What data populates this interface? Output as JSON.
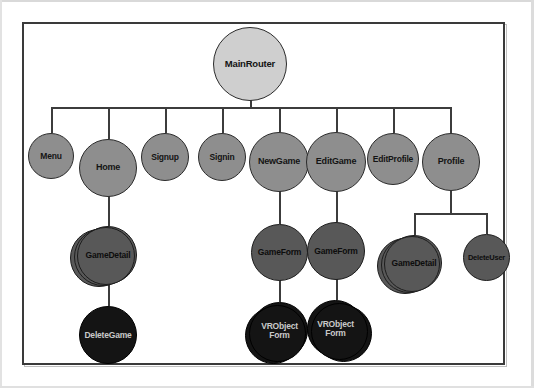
{
  "diagram": {
    "type": "tree",
    "colors": {
      "root_fill": "#cfcfcf",
      "level1_fill": "#8e8e8e",
      "level2_fill": "#585858",
      "level3_fill": "#141414",
      "stroke": "#2b2b2b",
      "frame": "#3a3a3a",
      "background": "#ffffff"
    },
    "root": {
      "id": "mainrouter",
      "label": "MainRouter"
    },
    "level1": [
      {
        "id": "menu",
        "label": "Menu"
      },
      {
        "id": "home",
        "label": "Home"
      },
      {
        "id": "signup",
        "label": "Signup"
      },
      {
        "id": "signin",
        "label": "Signin"
      },
      {
        "id": "newgame",
        "label": "NewGame"
      },
      {
        "id": "editgame",
        "label": "EditGame"
      },
      {
        "id": "editprofile",
        "label": "EditProfile"
      },
      {
        "id": "profile",
        "label": "Profile"
      }
    ],
    "level2": [
      {
        "id": "gamedetail-home",
        "label": "GameDetail",
        "parent": "home",
        "stacked": true
      },
      {
        "id": "gameform-new",
        "label": "GameForm",
        "parent": "newgame",
        "stacked": false
      },
      {
        "id": "gameform-edit",
        "label": "GameForm",
        "parent": "editgame",
        "stacked": false
      },
      {
        "id": "gamedetail-profile",
        "label": "GameDetail",
        "parent": "profile",
        "stacked": true
      },
      {
        "id": "deleteuser",
        "label": "DeleteUser",
        "parent": "profile",
        "stacked": false
      }
    ],
    "level3": [
      {
        "id": "deletegame",
        "label": "DeleteGame",
        "parent": "gamedetail-home",
        "stacked": false
      },
      {
        "id": "vrobjectform-new",
        "label_line1": "VRObject",
        "label_line2": "Form",
        "parent": "gameform-new",
        "stacked": true
      },
      {
        "id": "vrobjectform-edit",
        "label_line1": "VRObject",
        "label_line2": "Form",
        "parent": "gameform-edit",
        "stacked": true
      }
    ]
  }
}
